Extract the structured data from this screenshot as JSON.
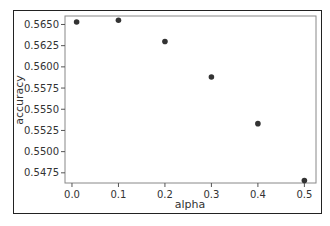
{
  "chart_data": {
    "type": "scatter",
    "title": "",
    "xlabel": "alpha",
    "ylabel": "accuracy",
    "x": [
      0.01,
      0.1,
      0.2,
      0.3,
      0.4,
      0.5
    ],
    "y": [
      0.5653,
      0.5655,
      0.563,
      0.5588,
      0.5533,
      0.5466
    ],
    "series": [
      {
        "name": "accuracy",
        "x": [
          0.01,
          0.1,
          0.2,
          0.3,
          0.4,
          0.5
        ],
        "values": [
          0.5653,
          0.5655,
          0.563,
          0.5588,
          0.5533,
          0.5466
        ],
        "color": "#333333"
      }
    ],
    "xticks": [
      "0.0",
      "0.1",
      "0.2",
      "0.3",
      "0.4",
      "0.5"
    ],
    "yticks": [
      "0.5475",
      "0.5500",
      "0.5525",
      "0.5550",
      "0.5575",
      "0.5600",
      "0.5625",
      "0.5650"
    ],
    "xlim": [
      -0.015,
      0.525
    ],
    "ylim": [
      0.5463,
      0.566
    ],
    "grid": false,
    "legend": null
  },
  "colors": {
    "marker": "#333333",
    "axis": "#555555",
    "frame": "#222222",
    "background": "#ffffff"
  }
}
